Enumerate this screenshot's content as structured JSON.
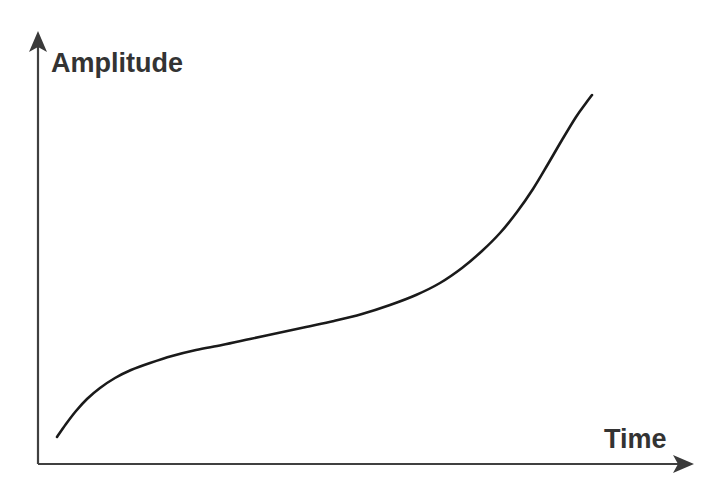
{
  "figure": {
    "title": "",
    "background_color": "#ffffff",
    "axis_color": "#404040",
    "curve_color": "#1a1a1a",
    "label_color": "#333333",
    "y_axis_label": "Amplitude",
    "x_axis_label": "Time",
    "y_axis_arrow_icon": "arrow-up-icon",
    "x_axis_arrow_icon": "arrow-right-icon"
  },
  "chart_data": {
    "type": "line",
    "title": "",
    "xlabel": "Time",
    "ylabel": "Amplitude",
    "xlim": [
      0,
      100
    ],
    "ylim": [
      0,
      100
    ],
    "grid": false,
    "legend": false,
    "axis_ticks": [],
    "series": [
      {
        "name": "Amplitude vs Time",
        "x": [
          3,
          6,
          9,
          12,
          17,
          20,
          25,
          29,
          34,
          39,
          45,
          50,
          55,
          61,
          66,
          70,
          74,
          78,
          81,
          84,
          86,
          88,
          90,
          92,
          94,
          95
        ],
        "y": [
          6,
          11,
          16,
          20,
          25,
          27,
          29,
          31,
          33,
          35,
          37,
          40,
          42,
          45,
          48,
          52,
          57,
          62,
          66,
          70,
          74,
          78,
          82,
          85,
          88,
          92
        ]
      }
    ],
    "pixel_geometry": {
      "origin": [
        38,
        464
      ],
      "y_axis_top": [
        38,
        33
      ],
      "x_axis_right": [
        692,
        464
      ],
      "curve_start": [
        57,
        437
      ],
      "curve_end": [
        592,
        95
      ],
      "curve_points": [
        [
          57,
          437
        ],
        [
          66,
          424
        ],
        [
          76,
          411
        ],
        [
          87,
          399
        ],
        [
          100,
          388
        ],
        [
          115,
          378
        ],
        [
          131,
          370
        ],
        [
          150,
          363
        ],
        [
          172,
          356
        ],
        [
          196,
          350
        ],
        [
          222,
          345
        ],
        [
          250,
          339
        ],
        [
          278,
          333
        ],
        [
          306,
          327
        ],
        [
          334,
          321
        ],
        [
          362,
          314
        ],
        [
          390,
          305
        ],
        [
          416,
          295
        ],
        [
          440,
          283
        ],
        [
          462,
          268
        ],
        [
          482,
          251
        ],
        [
          500,
          233
        ],
        [
          517,
          212
        ],
        [
          533,
          189
        ],
        [
          548,
          164
        ],
        [
          562,
          140
        ],
        [
          576,
          117
        ],
        [
          586,
          103
        ],
        [
          592,
          95
        ]
      ]
    }
  }
}
